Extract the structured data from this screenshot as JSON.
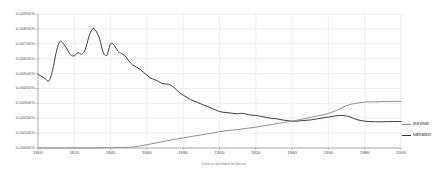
{
  "caption": "(click on line/label for focus)",
  "legend": {
    "items": [
      {
        "label": "survival",
        "color": "#8a8a8a"
      },
      {
        "label": "salvation",
        "color": "#333333"
      }
    ]
  },
  "axes": {
    "y_tick_labels": [
      "0.00900%",
      "0.00800%",
      "0.00700%",
      "0.00600%",
      "0.00500%",
      "0.00400%",
      "0.00300%",
      "0.00200%",
      "0.00100%",
      "0.00000%"
    ],
    "x_tick_labels": [
      "1800",
      "1820",
      "1840",
      "1860",
      "1880",
      "1900",
      "1920",
      "1940",
      "1960",
      "1980",
      "2000"
    ]
  },
  "chart_data": {
    "type": "line",
    "title": "",
    "xlabel": "",
    "ylabel": "",
    "xlim": [
      1800,
      2000
    ],
    "ylim": [
      0.0,
      0.009
    ],
    "y_unit": "%",
    "y_tick_step": 0.001,
    "x_tick_step": 20,
    "grid": true,
    "legend_position": "right",
    "annotations": [
      "(click on line/label for focus)"
    ],
    "series": [
      {
        "name": "salvation",
        "color": "#333333",
        "x": [
          1800,
          1802,
          1804,
          1806,
          1808,
          1810,
          1812,
          1814,
          1816,
          1818,
          1820,
          1822,
          1824,
          1826,
          1828,
          1830,
          1832,
          1834,
          1836,
          1838,
          1840,
          1842,
          1844,
          1846,
          1848,
          1850,
          1852,
          1854,
          1856,
          1858,
          1860,
          1862,
          1864,
          1866,
          1868,
          1870,
          1872,
          1874,
          1876,
          1878,
          1880,
          1882,
          1884,
          1886,
          1888,
          1890,
          1892,
          1894,
          1896,
          1898,
          1900,
          1902,
          1904,
          1906,
          1908,
          1910,
          1912,
          1914,
          1916,
          1918,
          1920,
          1922,
          1924,
          1926,
          1928,
          1930,
          1932,
          1934,
          1936,
          1938,
          1940,
          1942,
          1944,
          1946,
          1948,
          1950,
          1952,
          1954,
          1956,
          1958,
          1960,
          1962,
          1964,
          1966,
          1968,
          1970,
          1972,
          1974,
          1976,
          1978,
          1980,
          1982,
          1984,
          1986,
          1988,
          1990,
          1992,
          1994,
          1996,
          1998,
          2000
        ],
        "values": [
          0.00495,
          0.0048,
          0.00465,
          0.0045,
          0.0052,
          0.0064,
          0.00715,
          0.007,
          0.00665,
          0.00625,
          0.0062,
          0.0064,
          0.0063,
          0.0066,
          0.00745,
          0.008,
          0.00785,
          0.0073,
          0.0064,
          0.00625,
          0.007,
          0.0069,
          0.0065,
          0.00635,
          0.0062,
          0.00585,
          0.0056,
          0.00545,
          0.0053,
          0.0051,
          0.0049,
          0.0047,
          0.0046,
          0.0045,
          0.00435,
          0.0043,
          0.00428,
          0.00415,
          0.00395,
          0.0037,
          0.00355,
          0.0034,
          0.00325,
          0.00315,
          0.00305,
          0.00295,
          0.00285,
          0.00275,
          0.00265,
          0.00255,
          0.00245,
          0.0024,
          0.00238,
          0.00235,
          0.00232,
          0.0023,
          0.00233,
          0.0023,
          0.00225,
          0.0022,
          0.00218,
          0.00215,
          0.0021,
          0.00205,
          0.002,
          0.00198,
          0.00195,
          0.0019,
          0.00186,
          0.00183,
          0.0018,
          0.0018,
          0.00182,
          0.00184,
          0.00186,
          0.00188,
          0.00192,
          0.00196,
          0.002,
          0.00204,
          0.00208,
          0.00212,
          0.00216,
          0.00218,
          0.00218,
          0.00215,
          0.00208,
          0.00198,
          0.0019,
          0.00184,
          0.0018,
          0.00178,
          0.00177,
          0.00176,
          0.00176,
          0.00176,
          0.00177,
          0.00177,
          0.00178,
          0.00178,
          0.00178
        ]
      },
      {
        "name": "survival",
        "color": "#8a8a8a",
        "x": [
          1800,
          1810,
          1820,
          1830,
          1840,
          1850,
          1855,
          1860,
          1865,
          1870,
          1875,
          1880,
          1885,
          1890,
          1895,
          1900,
          1905,
          1910,
          1915,
          1920,
          1925,
          1930,
          1935,
          1940,
          1945,
          1950,
          1955,
          1960,
          1965,
          1970,
          1975,
          1980,
          1985,
          1990,
          1995,
          2000
        ],
        "values": [
          0.0,
          0.0,
          0.0,
          1e-05,
          2e-05,
          5e-05,
          0.00012,
          0.00022,
          0.00034,
          0.00046,
          0.00058,
          0.00068,
          0.00078,
          0.00088,
          0.00098,
          0.0011,
          0.00118,
          0.00124,
          0.00132,
          0.0014,
          0.0015,
          0.0016,
          0.0017,
          0.0018,
          0.00192,
          0.00205,
          0.00218,
          0.00232,
          0.00255,
          0.00285,
          0.003,
          0.00308,
          0.0031,
          0.00312,
          0.00313,
          0.00313
        ]
      }
    ]
  }
}
